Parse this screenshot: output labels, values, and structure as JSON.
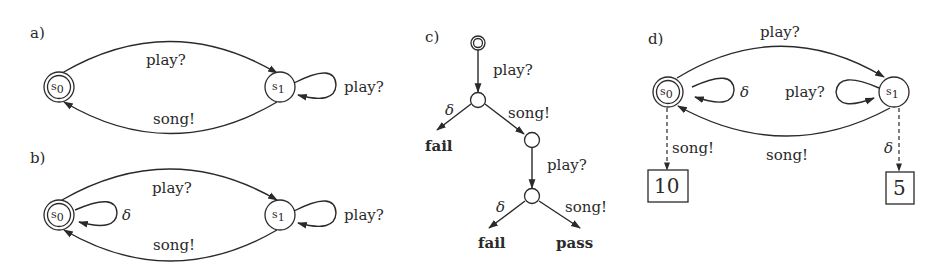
{
  "panels": {
    "a": {
      "label": "a)",
      "states": [
        {
          "id": "s0",
          "name": "s",
          "sub": "0",
          "initial": true
        },
        {
          "id": "s1",
          "name": "s",
          "sub": "1",
          "initial": false
        }
      ],
      "edges": [
        {
          "from": "s0",
          "to": "s1",
          "label": "play?"
        },
        {
          "from": "s1",
          "to": "s0",
          "label": "song!"
        },
        {
          "from": "s1",
          "to": "s1",
          "label": "play?"
        }
      ]
    },
    "b": {
      "label": "b)",
      "states": [
        {
          "id": "s0",
          "name": "s",
          "sub": "0",
          "initial": true
        },
        {
          "id": "s1",
          "name": "s",
          "sub": "1",
          "initial": false
        }
      ],
      "edges": [
        {
          "from": "s0",
          "to": "s1",
          "label": "play?"
        },
        {
          "from": "s1",
          "to": "s0",
          "label": "song!"
        },
        {
          "from": "s0",
          "to": "s0",
          "label": "δ"
        },
        {
          "from": "s1",
          "to": "s1",
          "label": "play?"
        }
      ]
    },
    "c": {
      "label": "c)",
      "edges": [
        {
          "label": "play?"
        },
        {
          "label": "δ"
        },
        {
          "label": "song!"
        },
        {
          "label": "play?"
        },
        {
          "label": "δ"
        },
        {
          "label": "song!"
        }
      ],
      "verdicts": [
        "fail",
        "fail",
        "pass"
      ]
    },
    "d": {
      "label": "d)",
      "states": [
        {
          "id": "s0",
          "name": "s",
          "sub": "0",
          "initial": true
        },
        {
          "id": "s1",
          "name": "s",
          "sub": "1",
          "initial": false
        }
      ],
      "edges": [
        {
          "from": "s0",
          "to": "s1",
          "label": "play?"
        },
        {
          "from": "s1",
          "to": "s0",
          "label": "song!"
        },
        {
          "from": "s0",
          "to": "s0",
          "label": "δ"
        },
        {
          "from": "s1",
          "to": "s1",
          "label": "play?"
        },
        {
          "from": "s0",
          "to": "reward0",
          "label": "song!",
          "dashed": true
        },
        {
          "from": "s1",
          "to": "reward1",
          "label": "δ",
          "dashed": true
        }
      ],
      "rewards": [
        "10",
        "5"
      ]
    }
  }
}
